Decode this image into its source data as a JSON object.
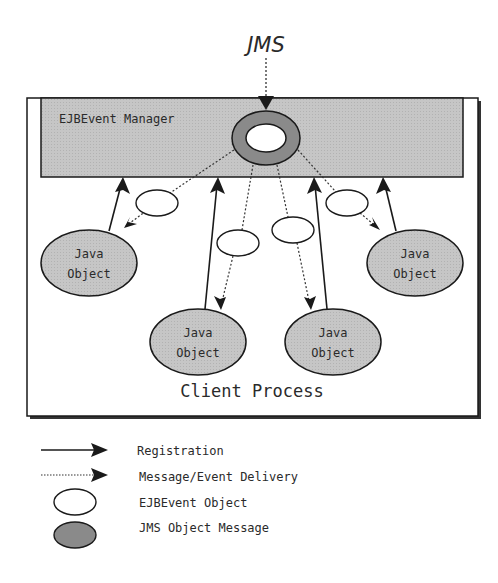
{
  "diagram": {
    "source_label": "JMS",
    "manager_label": "EJBEvent Manager",
    "process_label": "Client Process",
    "java_objects": [
      {
        "line1": "Java",
        "line2": "Object"
      },
      {
        "line1": "Java",
        "line2": "Object"
      },
      {
        "line1": "Java",
        "line2": "Object"
      },
      {
        "line1": "Java",
        "line2": "Object"
      }
    ]
  },
  "legend": {
    "items": [
      {
        "symbol": "solid-arrow",
        "label": "Registration"
      },
      {
        "symbol": "dotted-arrow",
        "label": "Message/Event Delivery"
      },
      {
        "symbol": "white-ellipse",
        "label": "EJBEvent Object"
      },
      {
        "symbol": "gray-ellipse",
        "label": "JMS Object Message"
      }
    ]
  },
  "colors": {
    "manager_fill": "#c4c4c4",
    "java_object_fill": "#c8c8c8",
    "jms_message_fill": "#8a8a8a",
    "stroke": "#1a1a1a",
    "text": "#2a2a2a"
  }
}
